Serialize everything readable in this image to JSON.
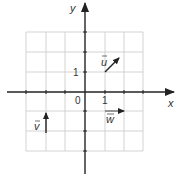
{
  "diagram": {
    "type": "coordinate-plane-vectors",
    "axes": {
      "x_label": "x",
      "y_label": "y",
      "origin_label": "0",
      "x_tick_label": "1",
      "y_tick_label": "1"
    },
    "grid": {
      "x_range": [
        -3,
        3
      ],
      "y_range": [
        -3,
        3
      ],
      "step": 1
    },
    "vectors": [
      {
        "name": "u",
        "label": "u",
        "from": [
          1,
          1
        ],
        "to": [
          1.7,
          1.7
        ]
      },
      {
        "name": "v",
        "label": "v",
        "from": [
          -2,
          -2
        ],
        "to": [
          -2,
          -1
        ]
      },
      {
        "name": "w",
        "label": "w",
        "from": [
          1,
          -1
        ],
        "to": [
          2,
          -1
        ]
      }
    ],
    "colors": {
      "grid": "#c8c8c8",
      "axis": "#222222",
      "vector": "#222222"
    }
  }
}
